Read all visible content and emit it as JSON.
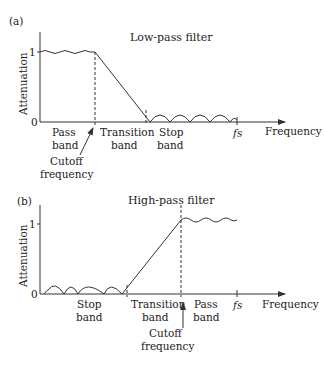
{
  "panel_a": {
    "tag": "(a)",
    "title": "Low-pass filter",
    "ylabel": "Attenuation",
    "y_ticks": [
      "1",
      "0"
    ],
    "xlabel": "Frequency",
    "fs_label": "fs",
    "regions": [
      {
        "line1": "Pass",
        "line2": "band"
      },
      {
        "line1": "Transition",
        "line2": "band"
      },
      {
        "line1": "Stop",
        "line2": "band"
      }
    ],
    "cutoff": {
      "line1": "Cutoff",
      "line2": "frequency"
    }
  },
  "panel_b": {
    "tag": "(b)",
    "title": "High-pass filter",
    "ylabel": "Attenuation",
    "y_ticks": [
      "1",
      "0"
    ],
    "xlabel": "Frequency",
    "fs_label": "fs",
    "regions": [
      {
        "line1": "Stop",
        "line2": "band"
      },
      {
        "line1": "Transition",
        "line2": "band"
      },
      {
        "line1": "Pass",
        "line2": "band"
      }
    ],
    "cutoff": {
      "line1": "Cutoff",
      "line2": "frequency"
    }
  },
  "colors": {
    "line": "#333333",
    "text": "#222222"
  }
}
